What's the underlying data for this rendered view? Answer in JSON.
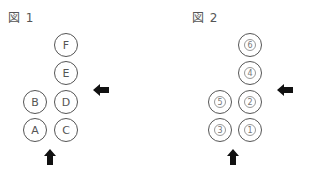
{
  "figure1": {
    "title": "図 1",
    "circles": [
      {
        "label": "F",
        "x": 54,
        "y": 33
      },
      {
        "label": "E",
        "x": 54,
        "y": 61
      },
      {
        "label": "B",
        "x": 23,
        "y": 90
      },
      {
        "label": "D",
        "x": 54,
        "y": 90
      },
      {
        "label": "A",
        "x": 23,
        "y": 118
      },
      {
        "label": "C",
        "x": 54,
        "y": 118
      }
    ],
    "arrows": [
      {
        "direction": "left",
        "icon": "arrow-left-icon"
      },
      {
        "direction": "up",
        "icon": "arrow-up-icon"
      }
    ]
  },
  "figure2": {
    "title": "図 2",
    "circles": [
      {
        "label": "6",
        "x": 238,
        "y": 33
      },
      {
        "label": "4",
        "x": 238,
        "y": 61
      },
      {
        "label": "5",
        "x": 208,
        "y": 90
      },
      {
        "label": "2",
        "x": 238,
        "y": 90
      },
      {
        "label": "3",
        "x": 208,
        "y": 118
      },
      {
        "label": "1",
        "x": 238,
        "y": 118
      }
    ],
    "arrows": [
      {
        "direction": "left",
        "icon": "arrow-left-icon"
      },
      {
        "direction": "up",
        "icon": "arrow-up-icon"
      }
    ]
  }
}
